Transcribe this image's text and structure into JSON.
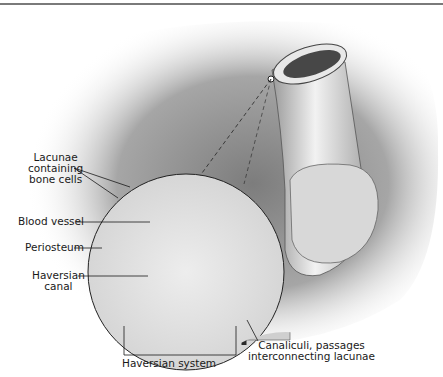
{
  "figure": {
    "labels": {
      "lacunae": [
        "Lacunae",
        "containing",
        "bone cells"
      ],
      "blood_vessel": "Blood vessel",
      "periosteum": "Periosteum",
      "haversian_canal": [
        "Haversian",
        "canal"
      ],
      "haversian_system": "Haversian system",
      "canaliculi": [
        "Canaliculi, passages",
        "interconnecting lacunae"
      ]
    }
  },
  "colors": {
    "background": "#ffffff",
    "shadow": "#9a9a9a",
    "inset_fill": "#e8e8e8",
    "line": "#1a1a1a"
  }
}
